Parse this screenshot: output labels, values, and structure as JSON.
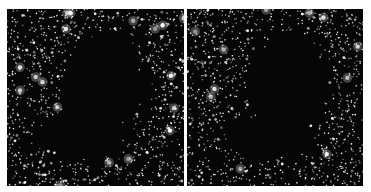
{
  "figure": {
    "panels": [
      {
        "id": "left",
        "subject": "dark-nebula-star-field",
        "star_count": 1400,
        "seed": 11,
        "background_color": "#060606",
        "star_color": "#ffffff"
      },
      {
        "id": "right",
        "subject": "dark-nebula-star-field",
        "star_count": 1400,
        "seed": 29,
        "background_color": "#060606",
        "star_color": "#ffffff"
      }
    ],
    "divider_color": "#ffffff"
  }
}
